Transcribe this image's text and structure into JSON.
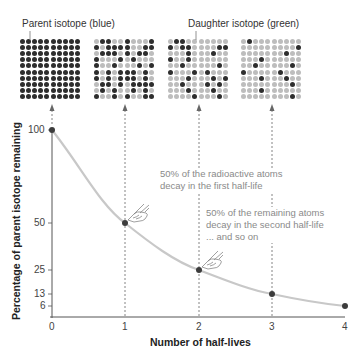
{
  "labels": {
    "parent": "Parent isotope (blue)",
    "daughter": "Daughter isotope (green)"
  },
  "colors": {
    "parent_dot": "#2e2e2e",
    "daughter_dot": "#bdbdbd",
    "curve": "#c8c8c8",
    "point": "#3c3c3c",
    "annotation_text": "#8a8a8a"
  },
  "grids": [
    [
      "1111111111",
      "1111111111",
      "1111111111",
      "1111111111",
      "1111111111",
      "1111111111",
      "1111111111",
      "1111111111",
      "1111111111",
      "1111111111"
    ],
    [
      "0110010001",
      "1011110011",
      "0111010110",
      "1000101000",
      "1001000101",
      "1010111010",
      "1010111010",
      "0110101111",
      "0101001010",
      "1001010011"
    ],
    [
      "0110000000",
      "1011000011",
      "0001000100",
      "1001000000",
      "0010000010",
      "1000101000",
      "0001000101",
      "0010001010",
      "0001000100",
      "0000100010"
    ],
    [
      "0100000000",
      "0000000001",
      "0000000100",
      "0001000000",
      "0010000010",
      "1000001000",
      "0001000100",
      "0000000010",
      "0001000000",
      "0000000010"
    ]
  ],
  "annotations": {
    "first_line1": "50% of the radioactive atoms",
    "first_line2": "decay in the first half-life",
    "second_line1": "50% of the remaining atoms",
    "second_line2": "decay in the second half-life",
    "second_line3": "... and so on"
  },
  "icons": {
    "hand_1": "pointing-hand-icon",
    "hand_2": "pointing-hand-icon"
  },
  "chart_data": {
    "type": "line",
    "title": "",
    "xlabel": "Number of half-lives",
    "ylabel": "Percentage of parent isotope remaining",
    "x": [
      0,
      1,
      2,
      3,
      4
    ],
    "series": [
      {
        "name": "Parent isotope remaining (%)",
        "values": [
          100,
          50,
          25,
          13,
          6
        ]
      }
    ],
    "x_ticks": [
      "0",
      "1",
      "2",
      "3",
      "4"
    ],
    "y_ticks": [
      "100",
      "50",
      "25",
      "13",
      "6"
    ],
    "xlim": [
      0,
      4
    ],
    "ylim": [
      0,
      100
    ],
    "grid": false,
    "legend": "none",
    "annotations": [
      "50% of the radioactive atoms decay in the first half-life",
      "50% of the remaining atoms decay in the second half-life ... and so on"
    ]
  }
}
